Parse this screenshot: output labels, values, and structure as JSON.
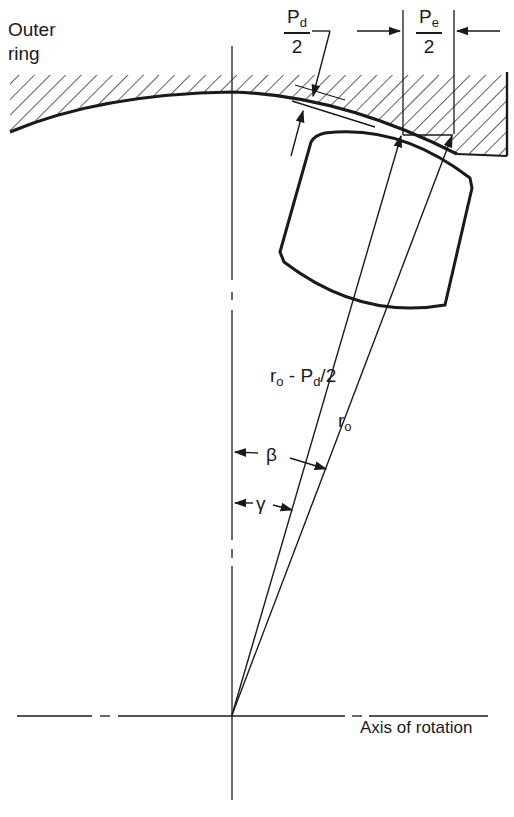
{
  "diagram": {
    "labels": {
      "outer_ring_line1": "Outer",
      "outer_ring_line2": "ring",
      "pd_num_main": "P",
      "pd_num_sub": "d",
      "pd_den": "2",
      "pe_num_main": "P",
      "pe_num_sub": "e",
      "pe_den": "2",
      "r_minus_main": "r",
      "r_minus_sub": "o",
      "r_minus_mid": " - P",
      "r_minus_sub2": "d",
      "r_minus_tail": "/2",
      "ro_main": "r",
      "ro_sub": "o",
      "beta": "β",
      "gamma": "γ",
      "axis_of_rotation": "Axis of rotation"
    },
    "colors": {
      "ink": "#1a1a1a",
      "background": "#ffffff"
    }
  }
}
